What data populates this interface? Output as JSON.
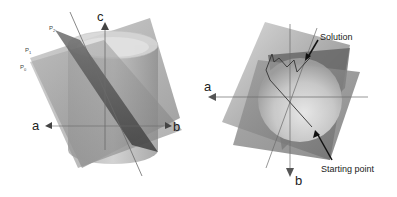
{
  "left_diagram": {
    "axes": {
      "a": "a",
      "b": "b",
      "c": "c"
    },
    "planes": [
      {
        "name": "P",
        "subscript": "2"
      },
      {
        "name": "P",
        "subscript": "1"
      },
      {
        "name": "P",
        "subscript": "0"
      }
    ]
  },
  "right_diagram": {
    "axes": {
      "a": "a",
      "b": "b"
    },
    "annotations": {
      "solution": "Solution",
      "starting_point": "Starting point"
    }
  },
  "colors": {
    "plane_light": "#b8b8b8",
    "plane_mid": "#8f8f8f",
    "plane_dark": "#5a5a5a",
    "cylinder": "#a8a8a8",
    "axis": "#555555",
    "text": "#222222"
  }
}
